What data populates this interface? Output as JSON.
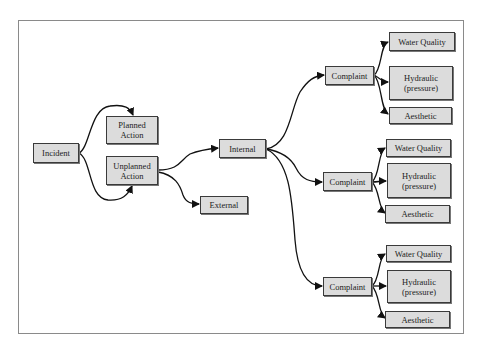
{
  "diagram": {
    "nodes": {
      "incident": "Incident",
      "planned": "Planned\nAction",
      "unplanned": "Unplanned\nAction",
      "internal": "Internal",
      "external": "External",
      "complaint1": "Complaint",
      "wq1": "Water Quality",
      "hyd1": "Hydraulic\n(pressure)",
      "aes1": "Aesthetic",
      "complaint2": "Complaint",
      "wq2": "Water Quality",
      "hyd2": "Hydraulic\n(pressure)",
      "aes2": "Aesthetic",
      "complaint3": "Complaint",
      "wq3": "Water Quality",
      "hyd3": "Hydraulic\n(pressure)",
      "aes3": "Aesthetic"
    },
    "edges": [
      [
        "incident",
        "planned"
      ],
      [
        "incident",
        "unplanned"
      ],
      [
        "unplanned",
        "internal"
      ],
      [
        "unplanned",
        "external"
      ],
      [
        "internal",
        "complaint1"
      ],
      [
        "internal",
        "complaint2"
      ],
      [
        "internal",
        "complaint3"
      ],
      [
        "complaint1",
        "wq1"
      ],
      [
        "complaint1",
        "hyd1"
      ],
      [
        "complaint1",
        "aes1"
      ],
      [
        "complaint2",
        "wq2"
      ],
      [
        "complaint2",
        "hyd2"
      ],
      [
        "complaint2",
        "aes2"
      ],
      [
        "complaint3",
        "wq3"
      ],
      [
        "complaint3",
        "hyd3"
      ],
      [
        "complaint3",
        "aes3"
      ]
    ],
    "colors": {
      "node_fill": "#dcdcdc",
      "node_border": "#3a3a3a",
      "edge": "#111111",
      "frame": "#8a8a8a"
    }
  }
}
